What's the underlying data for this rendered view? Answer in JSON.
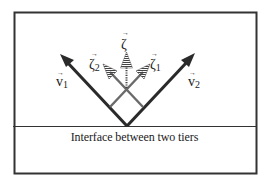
{
  "diagram": {
    "caption": "Interface between two tiers",
    "vectors": [
      {
        "id": "v1",
        "symbol": "v",
        "subscript": "1",
        "label": "v1"
      },
      {
        "id": "v2",
        "symbol": "v",
        "subscript": "2",
        "label": "v2"
      },
      {
        "id": "zeta",
        "symbol": "ζ",
        "subscript": "",
        "label": "ζ"
      },
      {
        "id": "zeta1",
        "symbol": "ζ",
        "subscript": "1",
        "label": "ζ1"
      },
      {
        "id": "zeta2",
        "symbol": "ζ",
        "subscript": "2",
        "label": "ζ2"
      }
    ],
    "vector_arrow_glyph": "→",
    "colors": {
      "frame": "#333333",
      "arrow": "#2a2a2a",
      "grey_arrow": "#6a6a6a",
      "background": "#ffffff"
    }
  }
}
